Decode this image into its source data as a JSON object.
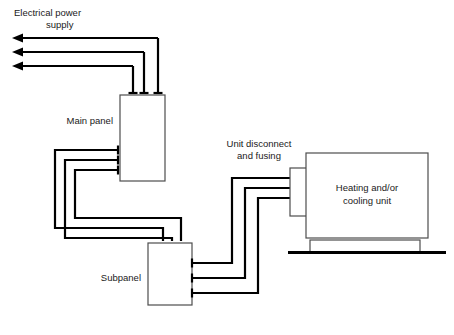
{
  "diagram": {
    "type": "single-line-wiring-diagram",
    "background_color": "#ffffff",
    "wire_color": "#000000",
    "enclosure_stroke_color": "#4d4d4d",
    "labels": {
      "power_supply_line1": "Electrical power",
      "power_supply_line2": "supply",
      "main_panel": "Main panel",
      "subpanel": "Subpanel",
      "unit_disconnect_line1": "Unit disconnect",
      "unit_disconnect_line2": "and fusing",
      "unit_line1": "Heating and/or",
      "unit_line2": "cooling unit"
    },
    "components": [
      {
        "name": "main-panel",
        "label": "Main panel",
        "x": 120,
        "y": 95,
        "width": 45,
        "height": 86,
        "feed_conductors": 3,
        "outgoing_conductors": 3
      },
      {
        "name": "subpanel",
        "label": "Subpanel",
        "x": 148,
        "y": 243,
        "width": 44,
        "height": 62,
        "feed_conductors": 3,
        "outgoing_conductors": 3
      },
      {
        "name": "unit-disconnect",
        "label": "Unit disconnect and fusing",
        "x": 290,
        "y": 168,
        "width": 22,
        "height": 48,
        "incoming_conductors": 3
      },
      {
        "name": "heating-cooling-unit",
        "label": "Heating and/or cooling unit",
        "x": 306,
        "y": 153,
        "width": 122,
        "height": 85
      },
      {
        "name": "equipment-pad",
        "x": 310,
        "y": 240,
        "width": 110,
        "height": 12
      },
      {
        "name": "ground-line",
        "x1": 288,
        "y1": 252,
        "x2": 446,
        "y2": 252
      }
    ],
    "supply_arrows": [
      {
        "y": 38,
        "tip_x": 12,
        "tail_x": 158
      },
      {
        "y": 52,
        "tip_x": 12,
        "tail_x": 144
      },
      {
        "y": 66,
        "tip_x": 12,
        "tail_x": 133
      }
    ],
    "conductor_count": 3
  }
}
